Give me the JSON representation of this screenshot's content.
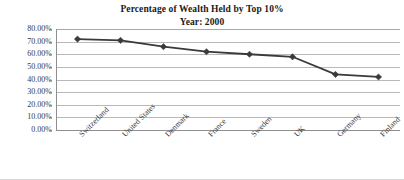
{
  "chart_data": {
    "type": "line",
    "title": "Percentage of Wealth Held by Top 10%",
    "subtitle": "Year: 2000",
    "xlabel": "",
    "ylabel": "",
    "ylim": [
      0,
      80
    ],
    "ytick_step": 10,
    "ytick_labels": [
      "80.00%",
      "70.00%",
      "60.00%",
      "50.00%",
      "40.00%",
      "30.00%",
      "20.00%",
      "10.00%",
      "0.00%"
    ],
    "ytick_values": [
      80,
      70,
      60,
      50,
      40,
      30,
      20,
      10,
      0
    ],
    "grid": true,
    "legend": "none",
    "marker": "diamond",
    "series_color": "#3a3a3a",
    "gridline_color": "#b9b9b9",
    "categories": [
      "Switzerland",
      "United States",
      "Denmark",
      "France",
      "Sweden",
      "UK",
      "Germany",
      "Finland"
    ],
    "values": [
      72,
      71,
      66,
      62,
      60,
      58,
      44,
      42
    ],
    "series": [
      {
        "name": "Percentage of Wealth Held by Top 10%",
        "values": [
          72,
          71,
          66,
          62,
          60,
          58,
          44,
          42
        ]
      }
    ]
  }
}
